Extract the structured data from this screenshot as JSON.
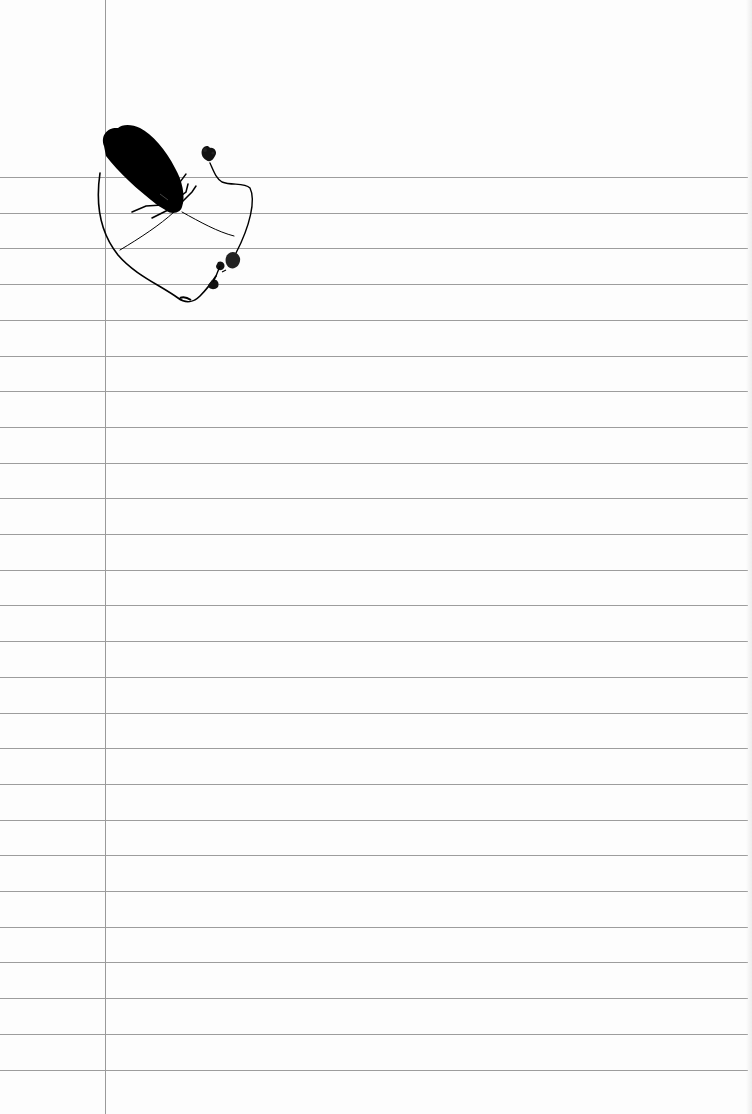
{
  "page": {
    "type": "ruled notebook paper",
    "background_color": "#fdfdfd",
    "rule_color": "#8c8c8c",
    "margin_color": "#9a9a9a",
    "margin_x": 105,
    "first_rule_y": 177,
    "rule_spacing": 35.7,
    "rule_count": 26
  },
  "illustration": {
    "subject": "black moth silhouette with a thin looping plant stem and small flower heads",
    "ink_color": "#000000"
  }
}
